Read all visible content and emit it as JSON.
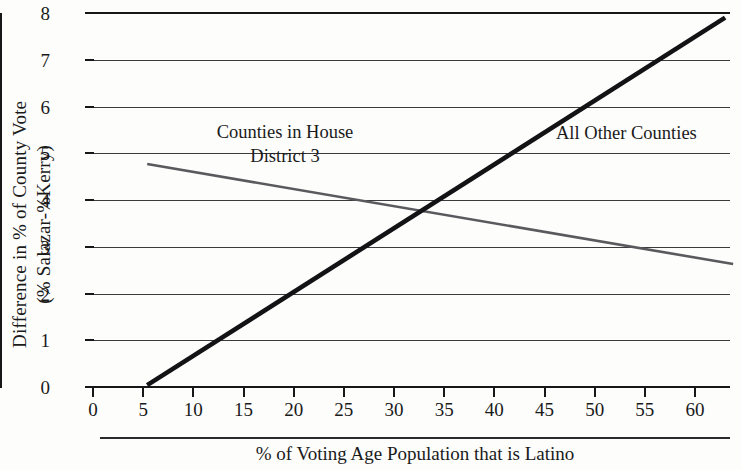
{
  "chart_data": {
    "type": "line",
    "title": "",
    "xlabel": "% of Voting Age Population that is Latino",
    "ylabel_line1": "Difference in % of County Vote",
    "ylabel_line2": "(% Salazar-%Kerry)",
    "xlim": [
      0,
      64
    ],
    "ylim": [
      0,
      8
    ],
    "xticks": [
      0,
      5,
      10,
      15,
      20,
      25,
      30,
      35,
      40,
      45,
      50,
      55,
      60
    ],
    "yticks": [
      0,
      1,
      2,
      3,
      4,
      5,
      6,
      7,
      8
    ],
    "xtick_labels": [
      "0",
      "5",
      "10",
      "15",
      "20",
      "25",
      "30",
      "35",
      "40",
      "45",
      "50",
      "55",
      "60"
    ],
    "ytick_labels": [
      "0",
      "1",
      "2",
      "3",
      "4",
      "5",
      "6",
      "7",
      "8"
    ],
    "grid": "horizontal",
    "legend": "inline-annotations",
    "series": [
      {
        "name": "Counties in House District 3",
        "color": "#5a5a5e",
        "width": 2.6,
        "points": [
          {
            "x": 5.4,
            "y": 4.77
          },
          {
            "x": 63.8,
            "y": 2.63
          }
        ],
        "annotation_line1": "Counties in House",
        "annotation_line2": "District 3"
      },
      {
        "name": "All Other Counties",
        "color": "#131316",
        "width": 4.6,
        "points": [
          {
            "x": 5.4,
            "y": 0.04
          },
          {
            "x": 63.0,
            "y": 7.9
          }
        ],
        "annotation_line1": "All Other Counties",
        "annotation_line2": ""
      }
    ],
    "intersection": {
      "x": 31.4,
      "y": 3.7
    }
  }
}
